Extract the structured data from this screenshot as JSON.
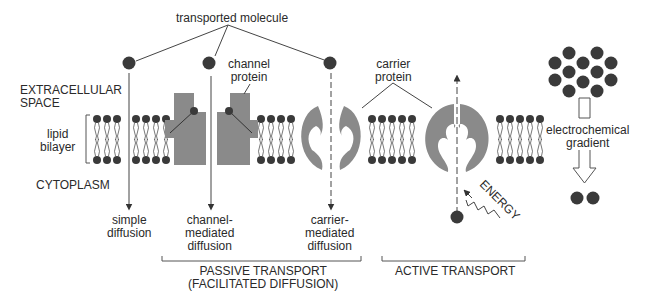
{
  "diagram": {
    "title_label": "transported molecule",
    "regions": {
      "extracellular": [
        "EXTRACELLULAR",
        "SPACE"
      ],
      "lipid_bilayer": [
        "lipid",
        "bilayer"
      ],
      "cytoplasm": "CYTOPLASM"
    },
    "proteins": {
      "channel": [
        "channel",
        "protein"
      ],
      "carrier": [
        "carrier",
        "protein"
      ]
    },
    "mechanisms": {
      "simple": [
        "simple",
        "diffusion"
      ],
      "channel_mediated": [
        "channel-",
        "mediated",
        "diffusion"
      ],
      "carrier_mediated": [
        "carrier-",
        "mediated",
        "diffusion"
      ]
    },
    "energy_label": "ENERGY",
    "gradient_label": [
      "electrochemical",
      "gradient"
    ],
    "groups": {
      "passive": [
        "PASSIVE TRANSPORT",
        "(FACILITATED DIFFUSION)"
      ],
      "active": "ACTIVE TRANSPORT"
    },
    "colors": {
      "protein_gray": "#8a8a8a",
      "molecule_dark": "#3a3a3a",
      "line": "#444444"
    }
  }
}
